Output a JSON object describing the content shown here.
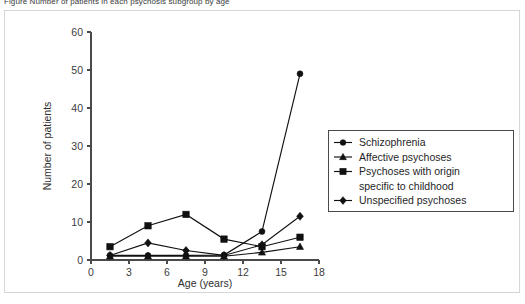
{
  "caption": {
    "text": "Figure  Number of patients in each psychosis subgroup by age"
  },
  "chart_data": {
    "type": "line",
    "title": "",
    "xlabel": "Age (years)",
    "ylabel": "Number of patients",
    "xlim": [
      0,
      18
    ],
    "ylim": [
      0,
      60
    ],
    "xticks": [
      0,
      3,
      6,
      9,
      12,
      15,
      18
    ],
    "yticks": [
      0,
      10,
      20,
      30,
      40,
      50,
      60
    ],
    "grid": false,
    "legend_position": "right",
    "x": [
      1.5,
      4.5,
      7.5,
      10.5,
      13.5,
      16.5
    ],
    "series": [
      {
        "name": "Schizophrenia",
        "marker": "circle",
        "values": [
          1.2,
          1.2,
          1.2,
          1.3,
          7.5,
          49
        ]
      },
      {
        "name": "Affective psychoses",
        "marker": "triangle",
        "values": [
          1.0,
          1.0,
          1.0,
          1.0,
          2.0,
          3.5
        ]
      },
      {
        "name": "Psychoses with origin specific to childhood",
        "marker": "square",
        "values": [
          3.5,
          9.0,
          12.0,
          5.5,
          3.5,
          6.0
        ]
      },
      {
        "name": "Unspecified psychoses",
        "marker": "diamond",
        "values": [
          1.2,
          4.5,
          2.5,
          1.2,
          4.0,
          11.5
        ]
      }
    ]
  },
  "legend": {
    "entries": [
      {
        "label": "Schizophrenia",
        "marker": "circle"
      },
      {
        "label": "Affective psychoses",
        "marker": "triangle"
      },
      {
        "label": "Psychoses with origin",
        "marker": "square"
      },
      {
        "label": "specific to childhood",
        "marker": "none"
      },
      {
        "label": "Unspecified psychoses",
        "marker": "diamond"
      }
    ]
  },
  "colors": {
    "ink": "#111111",
    "axis": "#4a4a4a",
    "panel_border": "#d6d6d6",
    "background": "#ffffff"
  }
}
